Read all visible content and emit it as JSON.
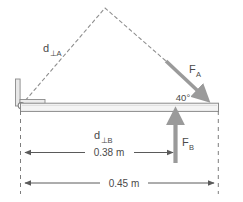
{
  "diagram": {
    "background_color": "#ffffff",
    "line_color": "#808080",
    "text_color": "#4a4a4a",
    "arrow_color": "#8c8c8c",
    "beam_fill": "#f2f2f2"
  },
  "labels": {
    "d_perp_a": "d",
    "d_perp_a_sub": "⊥A",
    "d_perp_b": "d",
    "d_perp_b_sub": "⊥B",
    "force_a": "F",
    "force_a_sub": "A",
    "force_b": "F",
    "force_b_sub": "B",
    "angle": "40°"
  },
  "dimensions": {
    "inner": "0.38 m",
    "outer": "0.45 m"
  },
  "values": {
    "angle_degrees": 40,
    "d_perp_b_meters": 0.38,
    "beam_length_meters": 0.45
  },
  "elements": {
    "pivot_name": "pivot-hinge",
    "beam_name": "horizontal-beam",
    "wall_name": "wall-support"
  }
}
